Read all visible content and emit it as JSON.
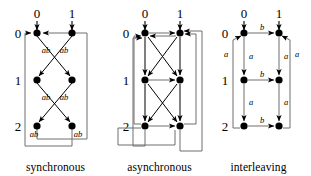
{
  "figure": {
    "kind": "transition-system-diagrams",
    "panel_count": 3,
    "colors": {
      "node": "#000000",
      "edge": "#000000",
      "frame_edge": "#6f6f6f",
      "background": "#ffffff",
      "text": "#000000"
    }
  },
  "panels": [
    {
      "id": "synchronous",
      "caption": "synchronous",
      "column_labels": [
        "0",
        "1"
      ],
      "row_labels": [
        "0",
        "1",
        "2"
      ],
      "edge_labels": [
        "ab",
        "ab",
        "ab",
        "ab",
        "ab",
        "ab"
      ],
      "label_text": "ab",
      "node_grid": [
        [
          "0,0",
          "0,1"
        ],
        [
          "1,0",
          "1,1"
        ],
        [
          "2,0",
          "2,1"
        ]
      ]
    },
    {
      "id": "asynchronous",
      "caption": "asynchronous",
      "column_labels": [
        "0",
        "1"
      ],
      "row_labels": [
        "0",
        "1",
        "2"
      ],
      "edge_labels": [],
      "node_grid": [
        [
          "0,0",
          "0,1"
        ],
        [
          "1,0",
          "1,1"
        ],
        [
          "2,0",
          "2,1"
        ]
      ]
    },
    {
      "id": "interleaving",
      "caption": "interleaving",
      "column_labels": [
        "0",
        "1"
      ],
      "row_labels": [
        "0",
        "1",
        "2"
      ],
      "edge_labels": {
        "horizontal": [
          "b",
          "b",
          "b"
        ],
        "vertical_left": [
          "a",
          "a"
        ],
        "vertical_right": [
          "a",
          "a"
        ],
        "outer_left": "a",
        "outer_right": "a"
      },
      "node_grid": [
        [
          "0,0",
          "0,1"
        ],
        [
          "1,0",
          "1,1"
        ],
        [
          "2,0",
          "2,1"
        ]
      ]
    }
  ],
  "captions": {
    "synchronous": "synchronous",
    "asynchronous": "asynchronous",
    "interleaving": "interleaving"
  },
  "labels": {
    "col0": "0",
    "col1": "1",
    "row0": "0",
    "row1": "1",
    "row2": "2",
    "ab": "ab",
    "a": "a",
    "b": "b"
  }
}
